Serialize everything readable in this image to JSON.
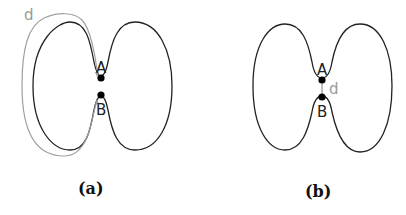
{
  "figures": [
    {
      "id": "a",
      "caption": "(a)",
      "point_labels": [
        "A",
        "B"
      ],
      "distance_label": "d",
      "distance_description": "path distance along curve from A to B"
    },
    {
      "id": "b",
      "caption": "(b)",
      "point_labels": [
        "A",
        "B"
      ],
      "distance_label": "d",
      "distance_description": "straight-line distance between A and B"
    }
  ],
  "colors": {
    "curve": "#222222",
    "distance": "#9a9a9a",
    "point": "#000000"
  }
}
